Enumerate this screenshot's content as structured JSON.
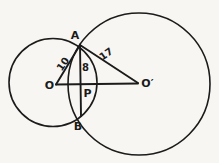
{
  "figure": {
    "type": "geometry-diagram",
    "points": {
      "A": "A",
      "B": "B",
      "O": "O",
      "O_prime": "O′",
      "P": "P"
    },
    "measurements": {
      "OA": "10",
      "AO_prime": "17",
      "AP": "8"
    },
    "colors": {
      "ink": "#1b1b1b",
      "paper": "#f7f6f2"
    }
  }
}
